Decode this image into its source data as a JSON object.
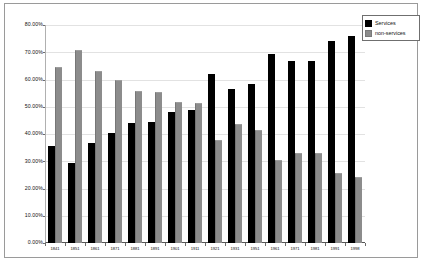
{
  "chart_data": {
    "type": "bar",
    "title": "",
    "subtitle": "",
    "xlabel": "",
    "ylabel": "",
    "ylim": [
      0,
      80
    ],
    "grid": true,
    "legend_position": "top-right",
    "y_tick_labels": [
      "80.00%",
      "70.00%",
      "60.00%",
      "50.00%",
      "40.00%",
      "30.00%",
      "20.00%",
      "10.00%",
      "0.00%"
    ],
    "y_tick_values": [
      80,
      70,
      60,
      50,
      40,
      30,
      20,
      10,
      0
    ],
    "categories": [
      "1841",
      "1851",
      "1861",
      "1871",
      "1881",
      "1891",
      "1901",
      "1911",
      "1921",
      "1931",
      "1951",
      "1961",
      "1971",
      "1981",
      "1991",
      "1998"
    ],
    "series": [
      {
        "name": "Services",
        "color": "#000000",
        "values": [
          35.5,
          29.3,
          36.8,
          40.3,
          44.1,
          44.4,
          48.2,
          48.8,
          62.1,
          56.4,
          58.5,
          69.5,
          66.8,
          66.8,
          74.3,
          75.8
        ]
      },
      {
        "name": "non-services",
        "color": "#8c8c8c",
        "values": [
          64.5,
          70.7,
          63.2,
          59.7,
          55.9,
          55.6,
          51.8,
          51.2,
          37.9,
          43.6,
          41.5,
          30.5,
          33.2,
          33.2,
          25.7,
          24.2
        ]
      }
    ]
  },
  "legend": {
    "items": [
      {
        "label": "Services",
        "color": "#000000"
      },
      {
        "label": "non-services",
        "color": "#8c8c8c"
      }
    ]
  },
  "colors": {
    "services": "#000000",
    "non_services": "#8c8c8c",
    "frame": "#9a9a9a",
    "gridline": "#e2e2e2",
    "axis": "#555555",
    "background": "#ffffff"
  }
}
